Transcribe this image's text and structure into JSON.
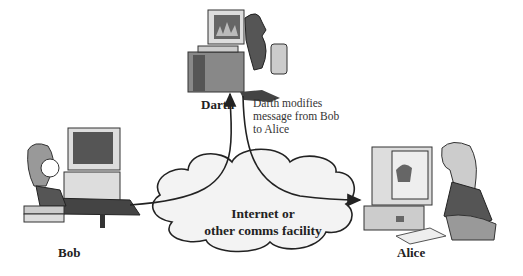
{
  "diagram": {
    "actors": {
      "darth": {
        "label": "Darth"
      },
      "bob": {
        "label": "Bob"
      },
      "alice": {
        "label": "Alice"
      }
    },
    "annotation": "Darth modifies message from Bob to Alice",
    "annotation_lines": [
      "Darth modifies",
      "message from Bob",
      "to Alice"
    ],
    "network": {
      "label_line1": "Internet or",
      "label_line2": "other comms facility"
    },
    "edges": [
      {
        "from": "Bob",
        "to": "Darth",
        "via": "Internet or other comms facility"
      },
      {
        "from": "Darth",
        "to": "Alice",
        "via": "Internet or other comms facility"
      }
    ]
  }
}
